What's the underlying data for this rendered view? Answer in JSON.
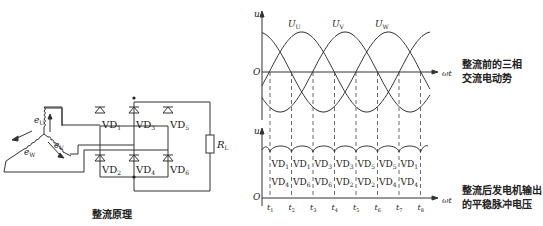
{
  "circuit": {
    "caption": "整流原理",
    "windings": {
      "u": "e",
      "u_sub": "U",
      "v": "e",
      "v_sub": "V",
      "w": "e",
      "w_sub": "W"
    },
    "diodes": [
      {
        "name": "VD",
        "sub": "1"
      },
      {
        "name": "VD",
        "sub": "3"
      },
      {
        "name": "VD",
        "sub": "5"
      },
      {
        "name": "VD",
        "sub": "2"
      },
      {
        "name": "VD",
        "sub": "4"
      },
      {
        "name": "VD",
        "sub": "6"
      }
    ],
    "load": {
      "name": "R",
      "sub": "L"
    }
  },
  "upper_plot": {
    "y_axis": "u",
    "origin": "O",
    "x_axis": "ωt",
    "phases": [
      {
        "name": "U",
        "sub": "U"
      },
      {
        "name": "U",
        "sub": "V"
      },
      {
        "name": "U",
        "sub": "W"
      }
    ],
    "description_line1": "整流前的三相",
    "description_line2": "交流电动势"
  },
  "lower_plot": {
    "y_axis": "u",
    "origin": "O",
    "x_axis": "ωt",
    "time_marks": [
      "1",
      "2",
      "3",
      "4",
      "5",
      "6",
      "7",
      "8"
    ],
    "upper_diodes": [
      "1",
      "1",
      "3",
      "3",
      "5",
      "5",
      "1"
    ],
    "lower_diodes": [
      "4",
      "6",
      "6",
      "2",
      "2",
      "4",
      "4"
    ],
    "description_line1": "整流后发电机输出",
    "description_line2": "的平稳脉冲电压"
  }
}
